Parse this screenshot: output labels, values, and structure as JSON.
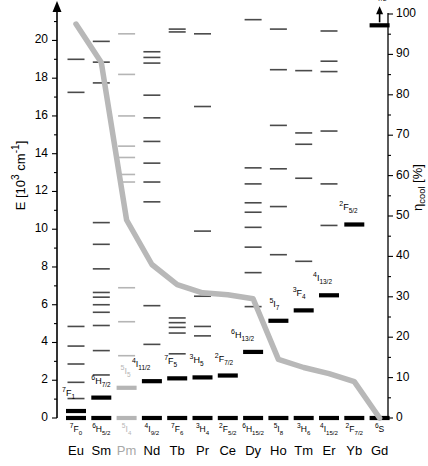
{
  "axes": {
    "left_label": "E [10³ cm⁻¹]",
    "right_label": "η_cool [%]",
    "left_ticks": [
      0,
      2,
      4,
      6,
      8,
      10,
      12,
      14,
      16,
      18,
      20
    ],
    "left_minor_step": 1,
    "left_range": [
      0,
      21.4
    ],
    "right_ticks": [
      0,
      10,
      20,
      30,
      40,
      50,
      60,
      70,
      80,
      90,
      100
    ],
    "right_minor_step": 5,
    "right_range": [
      0,
      100
    ],
    "left_arrow": true
  },
  "columns": [
    {
      "element": "Eu",
      "ground_state": "⁷F₀",
      "active": true
    },
    {
      "element": "Sm",
      "ground_state": "⁶H₅/₂",
      "active": true
    },
    {
      "element": "Pm",
      "ground_state": "⁵I₄",
      "active": false
    },
    {
      "element": "Nd",
      "ground_state": "⁴I₉/₂",
      "active": true
    },
    {
      "element": "Tb",
      "ground_state": "⁷F₆",
      "active": true
    },
    {
      "element": "Pr",
      "ground_state": "³H₄",
      "active": true
    },
    {
      "element": "Ce",
      "ground_state": "²F₅/₂",
      "active": true
    },
    {
      "element": "Dy",
      "ground_state": "⁶H₁₅/₂",
      "active": true
    },
    {
      "element": "Ho",
      "ground_state": "⁵I₈",
      "active": true
    },
    {
      "element": "Tm",
      "ground_state": "³H₆",
      "active": true
    },
    {
      "element": "Er",
      "ground_state": "⁴I₁₅/₂",
      "active": true
    },
    {
      "element": "Yb",
      "ground_state": "²F₇/₂",
      "active": true
    },
    {
      "element": "Gd",
      "ground_state": "⁶S",
      "active": true
    }
  ],
  "first_excited_labels": [
    {
      "element": "Eu",
      "text": "⁷F₁",
      "energy": 0.37
    },
    {
      "element": "Sm",
      "text": "⁶H₇/₂",
      "energy": 1.08
    },
    {
      "element": "Pm",
      "text": "⁵I₅",
      "energy": 1.6,
      "inactive": true
    },
    {
      "element": "Nd",
      "text": "⁴I₁₁/₂",
      "energy": 1.95
    },
    {
      "element": "Tb",
      "text": "⁷F₅",
      "energy": 2.1
    },
    {
      "element": "Pr",
      "text": "³H₅",
      "energy": 2.15
    },
    {
      "element": "Ce",
      "text": "²F₇/₂",
      "energy": 2.25
    },
    {
      "element": "Dy",
      "text": "⁶H₁₃/₂",
      "energy": 3.5
    },
    {
      "element": "Ho",
      "text": "⁵I₇",
      "energy": 5.15
    },
    {
      "element": "Tm",
      "text": "³F₄",
      "energy": 5.7
    },
    {
      "element": "Er",
      "text": "⁴I₁₃/₂",
      "energy": 6.5
    },
    {
      "element": "Yb",
      "text": "²F₅/₂",
      "energy": 10.25
    },
    {
      "element": "Gd",
      "text": "⁶P₇/₂",
      "energy": 20.8
    }
  ],
  "chart_data": {
    "type": "line",
    "title": "",
    "xlabel": "",
    "ylabel": "E [10³ cm⁻¹]",
    "y2label": "η_cool [%]",
    "ylim": [
      0,
      21.4
    ],
    "y2lim": [
      0,
      100
    ],
    "categories": [
      "Eu",
      "Sm",
      "Pm",
      "Nd",
      "Tb",
      "Pr",
      "Ce",
      "Dy",
      "Ho",
      "Tm",
      "Er",
      "Yb",
      "Gd"
    ],
    "series": [
      {
        "name": "η_cool",
        "color": "#b8b8b8",
        "units": "%",
        "values": [
          97.5,
          88.0,
          49.0,
          38.0,
          33.0,
          31.0,
          30.5,
          29.5,
          14.5,
          12.5,
          11.0,
          9.0,
          0.0
        ]
      }
    ],
    "levels": {
      "units": "10³ cm⁻¹",
      "ground_color": "#000000",
      "excited_color": "#4a4a4a",
      "inactive_color": "#b5b5b5",
      "Eu": [
        0,
        0.37,
        1.03,
        1.89,
        2.86,
        3.81,
        4.85,
        17.25,
        19.0
      ],
      "Sm": [
        0,
        1.08,
        2.28,
        3.57,
        4.9,
        5.6,
        6.0,
        6.4,
        6.65,
        7.9,
        9.2,
        10.35,
        17.75,
        18.85,
        19.95
      ],
      "Pm": [
        0,
        1.6,
        3.3,
        5.1,
        6.9,
        12.5,
        12.9,
        13.8,
        14.4,
        16.0,
        18.2,
        20.35
      ],
      "Nd": [
        0,
        1.95,
        3.9,
        5.95,
        11.45,
        12.5,
        13.5,
        14.65,
        15.9,
        17.1,
        18.8,
        19.1,
        19.4
      ],
      "Tb": [
        0,
        2.1,
        3.4,
        4.5,
        4.8,
        5.05,
        5.3,
        20.45,
        20.6
      ],
      "Pr": [
        0,
        2.15,
        4.35,
        4.85,
        6.45,
        9.9,
        16.5,
        20.35
      ],
      "Ce": [
        0,
        2.25
      ],
      "Dy": [
        0,
        3.5,
        5.9,
        7.7,
        9.05,
        10.1,
        10.9,
        11.4,
        12.4,
        13.25,
        21.1
      ],
      "Ho": [
        0,
        5.15,
        8.65,
        11.2,
        13.2,
        15.5,
        18.45,
        20.6
      ],
      "Tm": [
        0,
        5.7,
        8.3,
        12.7,
        14.5,
        15.1,
        18.4
      ],
      "Er": [
        0,
        6.5,
        10.2,
        12.4,
        15.2,
        18.35,
        18.9,
        20.5
      ],
      "Yb": [
        0,
        10.25
      ],
      "Gd": [
        0,
        20.8
      ]
    }
  }
}
